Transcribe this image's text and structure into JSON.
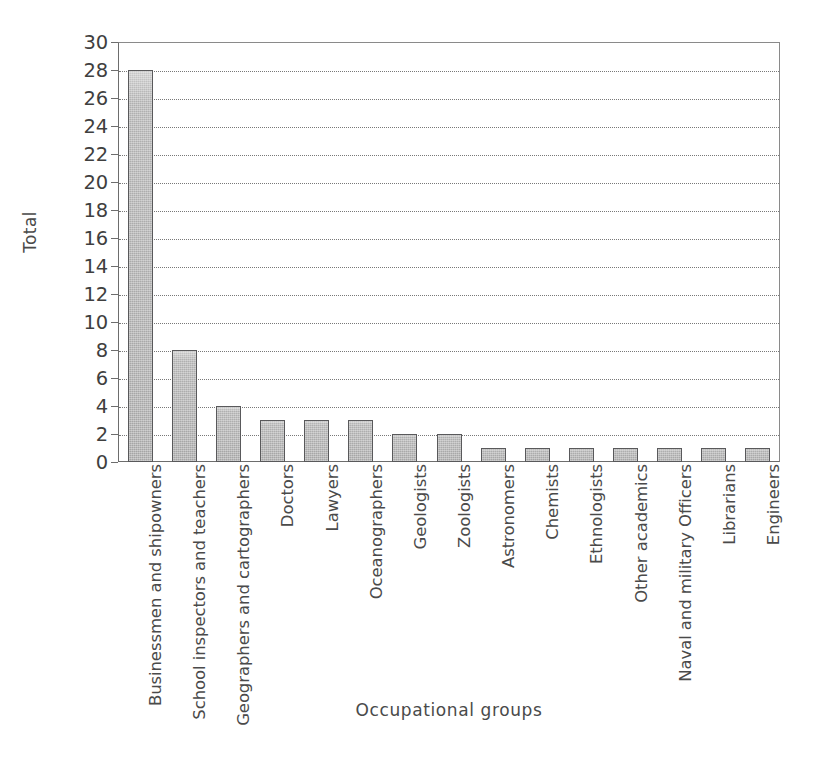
{
  "chart_data": {
    "type": "bar",
    "title": "",
    "xlabel": "Occupational groups",
    "ylabel": "Total",
    "ylim": [
      0,
      30
    ],
    "ytick_step": 2,
    "yticks": [
      0,
      2,
      4,
      6,
      8,
      10,
      12,
      14,
      16,
      18,
      20,
      22,
      24,
      26,
      28,
      30
    ],
    "grid": "horizontal-dotted",
    "legend": "none",
    "bar_fill_color": "#a8a8a8",
    "bar_edge_color": "#59595b",
    "axis_color": "#6d6d6d",
    "gridline_color": "#787878",
    "background_color": "#ffffff",
    "categories": [
      "Businessmen and shipowners",
      "School inspectors and teachers",
      "Geographers and cartographers",
      "Doctors",
      "Lawyers",
      "Oceanographers",
      "Geologists",
      "Zoologists",
      "Astronomers",
      "Chemists",
      "Ethnologists",
      "Other academics",
      "Naval and military Officers",
      "Librarians",
      "Engineers"
    ],
    "values": [
      28,
      8,
      4,
      3,
      3,
      3,
      2,
      2,
      1,
      1,
      1,
      1,
      1,
      1,
      1
    ]
  }
}
